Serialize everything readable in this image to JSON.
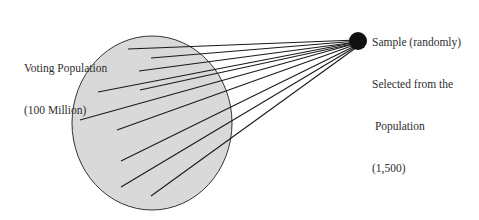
{
  "diagram": {
    "type": "sampling-illustration",
    "population": {
      "label_lines": [
        "Voting Population",
        "(100 Million)"
      ],
      "shape": "ellipse",
      "fill": "#d9d9d9",
      "stroke": "#333333"
    },
    "sample": {
      "label_lines": [
        "Sample (randomly)",
        "Selected from the",
        " Population",
        "(1,500)"
      ],
      "shape": "filled-dot",
      "fill": "#111111"
    },
    "connector_color": "#1a1a1a",
    "connector_count": 10
  }
}
